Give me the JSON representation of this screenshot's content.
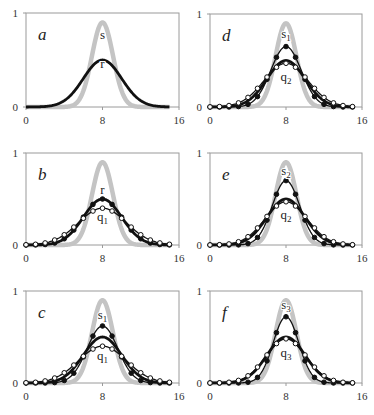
{
  "chart_data": [
    {
      "panel": "a",
      "type": "line",
      "xlim": [
        0,
        16
      ],
      "ylim": [
        0,
        1
      ],
      "xticks": [
        "0",
        "8",
        "16"
      ],
      "yticks": [
        "0",
        "1"
      ],
      "series": [
        {
          "name": "s",
          "style": "gray-thick",
          "peak": 0.9,
          "center": 8,
          "sigma": 1.1,
          "markers": "none"
        },
        {
          "name": "r",
          "style": "black-thick",
          "peak": 0.5,
          "center": 8,
          "sigma": 2.0,
          "markers": "none"
        }
      ],
      "labels": [
        {
          "text": "s",
          "sub": "",
          "x": 8,
          "y": 0.72
        },
        {
          "text": "r",
          "sub": "",
          "x": 8,
          "y": 0.42
        }
      ]
    },
    {
      "panel": "d",
      "type": "line",
      "xlim": [
        0,
        16
      ],
      "ylim": [
        0,
        1
      ],
      "xticks": [
        "0",
        "8",
        "16"
      ],
      "yticks": [
        "0",
        "1"
      ],
      "series": [
        {
          "name": "s1",
          "style": "gray-thick",
          "peak": 0.9,
          "center": 8,
          "sigma": 1.1,
          "markers": "none"
        },
        {
          "name": "r",
          "style": "black-thick",
          "peak": 0.5,
          "center": 8,
          "sigma": 2.0,
          "markers": "none"
        },
        {
          "name": "filled",
          "style": "black-thin",
          "peak": 0.65,
          "center": 8,
          "sigma": 1.6,
          "markers": "filled"
        },
        {
          "name": "q2",
          "style": "black-thin",
          "peak": 0.47,
          "center": 8,
          "sigma": 2.3,
          "markers": "open"
        }
      ],
      "labels": [
        {
          "text": "s",
          "sub": "1",
          "x": 8,
          "y": 0.74
        },
        {
          "text": "q",
          "sub": "2",
          "x": 8,
          "y": 0.28
        }
      ]
    },
    {
      "panel": "b",
      "type": "line",
      "xlim": [
        0,
        16
      ],
      "ylim": [
        0,
        1
      ],
      "xticks": [
        "0",
        "8",
        "16"
      ],
      "yticks": [
        "0",
        "1"
      ],
      "series": [
        {
          "name": "s",
          "style": "gray-thick",
          "peak": 0.9,
          "center": 8,
          "sigma": 1.1,
          "markers": "none"
        },
        {
          "name": "r",
          "style": "black-thick",
          "peak": 0.5,
          "center": 8,
          "sigma": 2.0,
          "markers": "filled"
        },
        {
          "name": "q1",
          "style": "black-thin",
          "peak": 0.4,
          "center": 8,
          "sigma": 2.5,
          "markers": "open"
        }
      ],
      "labels": [
        {
          "text": "r",
          "sub": "",
          "x": 8,
          "y": 0.55
        },
        {
          "text": "q",
          "sub": "1",
          "x": 8,
          "y": 0.26
        }
      ]
    },
    {
      "panel": "e",
      "type": "line",
      "xlim": [
        0,
        16
      ],
      "ylim": [
        0,
        1
      ],
      "xticks": [
        "0",
        "8",
        "16"
      ],
      "yticks": [
        "0",
        "1"
      ],
      "series": [
        {
          "name": "s2",
          "style": "gray-thick",
          "peak": 0.9,
          "center": 8,
          "sigma": 1.1,
          "markers": "none"
        },
        {
          "name": "r",
          "style": "black-thick",
          "peak": 0.5,
          "center": 8,
          "sigma": 2.0,
          "markers": "none"
        },
        {
          "name": "filled",
          "style": "black-thin",
          "peak": 0.7,
          "center": 8,
          "sigma": 1.45,
          "markers": "filled"
        },
        {
          "name": "q2",
          "style": "black-thin",
          "peak": 0.47,
          "center": 8,
          "sigma": 2.2,
          "markers": "open"
        }
      ],
      "labels": [
        {
          "text": "s",
          "sub": "2",
          "x": 8,
          "y": 0.76
        },
        {
          "text": "q",
          "sub": "2",
          "x": 8,
          "y": 0.28
        }
      ]
    },
    {
      "panel": "c",
      "type": "line",
      "xlim": [
        0,
        16
      ],
      "ylim": [
        0,
        1
      ],
      "xticks": [
        "0",
        "8",
        "16"
      ],
      "yticks": [
        "0",
        "1"
      ],
      "series": [
        {
          "name": "s1",
          "style": "gray-thick",
          "peak": 0.9,
          "center": 8,
          "sigma": 1.1,
          "markers": "none"
        },
        {
          "name": "r",
          "style": "black-thick",
          "peak": 0.5,
          "center": 8,
          "sigma": 2.0,
          "markers": "none"
        },
        {
          "name": "filled",
          "style": "black-thin",
          "peak": 0.62,
          "center": 8,
          "sigma": 1.6,
          "markers": "filled"
        },
        {
          "name": "q1",
          "style": "black-thin",
          "peak": 0.4,
          "center": 8,
          "sigma": 2.5,
          "markers": "open"
        }
      ],
      "labels": [
        {
          "text": "s",
          "sub": "1",
          "x": 8,
          "y": 0.7
        },
        {
          "text": "q",
          "sub": "1",
          "x": 8,
          "y": 0.25
        }
      ]
    },
    {
      "panel": "f",
      "type": "line",
      "xlim": [
        0,
        16
      ],
      "ylim": [
        0,
        1
      ],
      "xticks": [
        "0",
        "8",
        "16"
      ],
      "yticks": [
        "0",
        "1"
      ],
      "series": [
        {
          "name": "s3",
          "style": "gray-thick",
          "peak": 0.9,
          "center": 8,
          "sigma": 1.1,
          "markers": "none"
        },
        {
          "name": "r",
          "style": "black-thick",
          "peak": 0.5,
          "center": 8,
          "sigma": 2.0,
          "markers": "none"
        },
        {
          "name": "filled",
          "style": "black-thin",
          "peak": 0.72,
          "center": 8,
          "sigma": 1.35,
          "markers": "filled"
        },
        {
          "name": "q3",
          "style": "black-thin",
          "peak": 0.48,
          "center": 8,
          "sigma": 2.1,
          "markers": "open"
        }
      ],
      "labels": [
        {
          "text": "s",
          "sub": "3",
          "x": 8,
          "y": 0.8
        },
        {
          "text": "q",
          "sub": "3",
          "x": 8,
          "y": 0.28
        }
      ]
    }
  ],
  "layout": {
    "panels": [
      {
        "id": "a",
        "x0": 26,
        "x1": 179,
        "y0": 13,
        "y1": 107
      },
      {
        "id": "d",
        "x0": 210,
        "x1": 362,
        "y0": 14,
        "y1": 107
      },
      {
        "id": "b",
        "x0": 26,
        "x1": 179,
        "y0": 153,
        "y1": 245
      },
      {
        "id": "e",
        "x0": 210,
        "x1": 362,
        "y0": 153,
        "y1": 245
      },
      {
        "id": "c",
        "x0": 26,
        "x1": 179,
        "y0": 291,
        "y1": 383
      },
      {
        "id": "f",
        "x0": 210,
        "x1": 362,
        "y0": 291,
        "y1": 383
      }
    ]
  },
  "colors": {
    "gray": "#c4c4c4",
    "black": "#111111",
    "frame": "#9a9a9a"
  }
}
